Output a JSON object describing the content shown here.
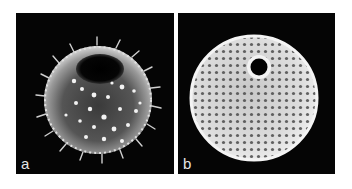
{
  "figure": {
    "panels": [
      {
        "id": "a",
        "label": "a",
        "description": "SEM micrograph of spiny (echinate) pollen grain with a single pore",
        "background": "#050505"
      },
      {
        "id": "b",
        "label": "b",
        "description": "SEM micrograph of reticulate pollen grain with a single pore",
        "background": "#050505"
      }
    ]
  }
}
